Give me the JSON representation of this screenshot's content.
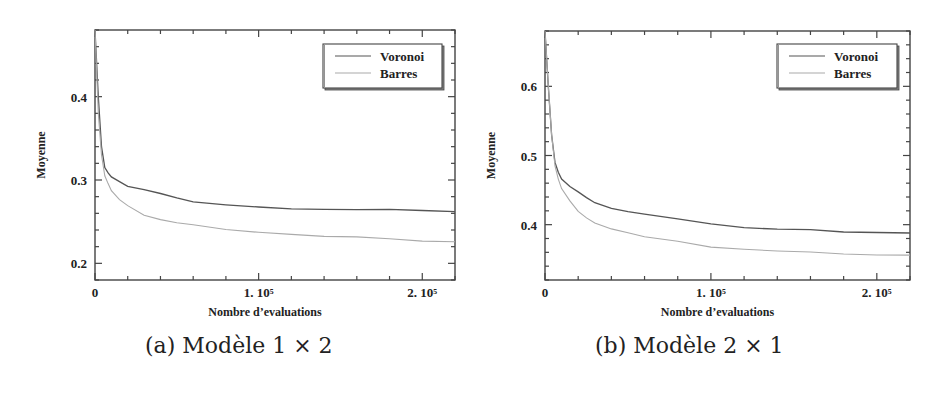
{
  "chart_data": [
    {
      "type": "line",
      "caption": "(a) Modèle 1 × 2",
      "xlabel": "Nombre d'evaluations",
      "ylabel": "Moyenne",
      "xlim": [
        0,
        220000
      ],
      "ylim": [
        0.18,
        0.48
      ],
      "x_tick_labels": [
        "0",
        "1. 10⁵",
        "2. 10⁵"
      ],
      "x_ticks": [
        0,
        100000,
        200000
      ],
      "y_tick_labels": [
        "0.2",
        "0.3",
        "0.4"
      ],
      "y_ticks": [
        0.2,
        0.3,
        0.4
      ],
      "grid": false,
      "legend_position": "upper right",
      "series": [
        {
          "name": "Voronoi",
          "color": "#555555",
          "x": [
            0,
            2000,
            4000,
            6000,
            8000,
            10000,
            15000,
            20000,
            30000,
            40000,
            50000,
            60000,
            80000,
            100000,
            120000,
            140000,
            160000,
            180000,
            200000,
            220000
          ],
          "y": [
            0.48,
            0.4,
            0.34,
            0.315,
            0.308,
            0.303,
            0.298,
            0.293,
            0.289,
            0.284,
            0.278,
            0.273,
            0.27,
            0.268,
            0.266,
            0.265,
            0.264,
            0.264,
            0.263,
            0.262
          ]
        },
        {
          "name": "Barres",
          "color": "#aaaaaa",
          "x": [
            0,
            2000,
            4000,
            6000,
            8000,
            10000,
            15000,
            20000,
            30000,
            40000,
            50000,
            60000,
            80000,
            100000,
            120000,
            140000,
            160000,
            180000,
            200000,
            220000
          ],
          "y": [
            0.48,
            0.38,
            0.33,
            0.305,
            0.295,
            0.287,
            0.277,
            0.27,
            0.258,
            0.252,
            0.248,
            0.246,
            0.241,
            0.238,
            0.235,
            0.232,
            0.231,
            0.229,
            0.227,
            0.226
          ]
        }
      ]
    },
    {
      "type": "line",
      "caption": "(b) Modèle 2 × 1",
      "xlabel": "Nombre d'evaluations",
      "ylabel": "Moyenne",
      "xlim": [
        0,
        220000
      ],
      "ylim": [
        0.32,
        0.68
      ],
      "x_tick_labels": [
        "0",
        "1. 10⁵",
        "2. 10⁵"
      ],
      "x_ticks": [
        0,
        100000,
        200000
      ],
      "y_tick_labels": [
        "0.4",
        "0.5",
        "0.6"
      ],
      "y_ticks": [
        0.4,
        0.5,
        0.6
      ],
      "grid": false,
      "legend_position": "upper right",
      "series": [
        {
          "name": "Voronoi",
          "color": "#555555",
          "x": [
            0,
            2000,
            4000,
            6000,
            8000,
            10000,
            15000,
            20000,
            25000,
            30000,
            40000,
            50000,
            60000,
            80000,
            100000,
            120000,
            140000,
            160000,
            180000,
            200000,
            220000
          ],
          "y": [
            0.68,
            0.6,
            0.53,
            0.49,
            0.475,
            0.465,
            0.455,
            0.448,
            0.44,
            0.432,
            0.423,
            0.418,
            0.415,
            0.409,
            0.402,
            0.396,
            0.393,
            0.392,
            0.389,
            0.389,
            0.388
          ]
        },
        {
          "name": "Barres",
          "color": "#aaaaaa",
          "x": [
            0,
            2000,
            4000,
            6000,
            8000,
            10000,
            15000,
            20000,
            25000,
            30000,
            40000,
            50000,
            60000,
            80000,
            100000,
            120000,
            140000,
            160000,
            180000,
            200000,
            220000
          ],
          "y": [
            0.68,
            0.6,
            0.53,
            0.485,
            0.465,
            0.452,
            0.435,
            0.42,
            0.41,
            0.402,
            0.393,
            0.388,
            0.383,
            0.377,
            0.368,
            0.364,
            0.361,
            0.36,
            0.358,
            0.357,
            0.356
          ]
        }
      ]
    }
  ],
  "captions": {
    "a": "(a) Modèle 1 × 2",
    "b": "(b) Modèle 2 × 1"
  }
}
